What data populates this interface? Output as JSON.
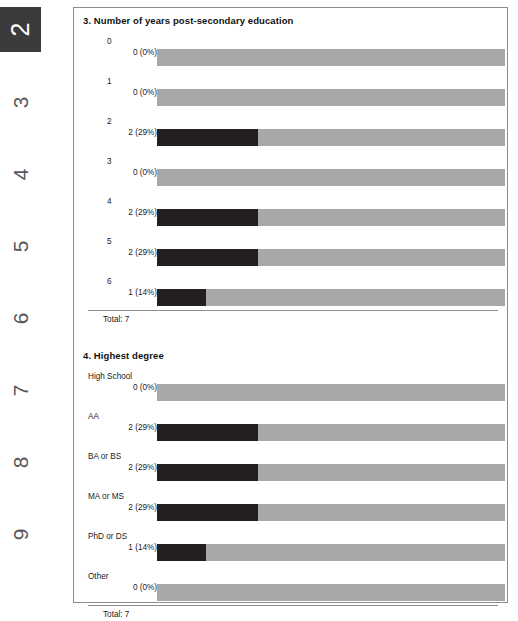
{
  "page_rail": {
    "name": "page-number-rail",
    "active_page": "2",
    "pages": [
      {
        "label": "2",
        "active": true
      },
      {
        "label": "3",
        "active": false
      },
      {
        "label": "4",
        "active": false
      },
      {
        "label": "5",
        "active": false
      },
      {
        "label": "6",
        "active": false
      },
      {
        "label": "7",
        "active": false
      },
      {
        "label": "8",
        "active": false
      },
      {
        "label": "9",
        "active": false
      }
    ]
  },
  "colors": {
    "bar_filled": "#231f20",
    "bar_track": "#a8a8a8",
    "panel_border": "#8d8d8d",
    "active_tab_bg": "#3b3b3b",
    "text": "#1a1a1a"
  },
  "chart_data": [
    {
      "type": "bar",
      "id": "chart1",
      "title": "3. Number of years post-secondary education",
      "orientation": "horizontal",
      "total_label": "Total: 7",
      "total": 7,
      "xlabel": "",
      "ylabel": "",
      "xlim": [
        0,
        100
      ],
      "grid": false,
      "legend": "none",
      "categories": [
        "0",
        "1",
        "2",
        "3",
        "4",
        "5",
        "6"
      ],
      "values": [
        0,
        0,
        2,
        0,
        2,
        2,
        1
      ],
      "percents": [
        0,
        0,
        29,
        0,
        29,
        29,
        14
      ],
      "value_labels": [
        "0 (0%)",
        "0 (0%)",
        "2 (29%)",
        "0 (0%)",
        "2 (29%)",
        "2 (29%)",
        "1 (14%)"
      ],
      "rows": [
        {
          "category": "0",
          "value": 0,
          "percent": 0,
          "value_label": "0 (0%)"
        },
        {
          "category": "1",
          "value": 0,
          "percent": 0,
          "value_label": "0 (0%)"
        },
        {
          "category": "2",
          "value": 2,
          "percent": 29,
          "value_label": "2 (29%)"
        },
        {
          "category": "3",
          "value": 0,
          "percent": 0,
          "value_label": "0 (0%)"
        },
        {
          "category": "4",
          "value": 2,
          "percent": 29,
          "value_label": "2 (29%)"
        },
        {
          "category": "5",
          "value": 2,
          "percent": 29,
          "value_label": "2 (29%)"
        },
        {
          "category": "6",
          "value": 1,
          "percent": 14,
          "value_label": "1 (14%)"
        }
      ]
    },
    {
      "type": "bar",
      "id": "chart2",
      "title": "4. Highest degree",
      "orientation": "horizontal",
      "total_label": "Total: 7",
      "total": 7,
      "xlabel": "",
      "ylabel": "",
      "xlim": [
        0,
        100
      ],
      "grid": false,
      "legend": "none",
      "categories": [
        "High School",
        "AA",
        "BA or BS",
        "MA or MS",
        "PhD or DS",
        "Other"
      ],
      "values": [
        0,
        2,
        2,
        2,
        1,
        0
      ],
      "percents": [
        0,
        29,
        29,
        29,
        14,
        0
      ],
      "value_labels": [
        "0 (0%)",
        "2 (29%)",
        "2 (29%)",
        "2 (29%)",
        "1 (14%)",
        "0 (0%)"
      ],
      "rows": [
        {
          "category": "High School",
          "value": 0,
          "percent": 0,
          "value_label": "0 (0%)"
        },
        {
          "category": "AA",
          "value": 2,
          "percent": 29,
          "value_label": "2 (29%)"
        },
        {
          "category": "BA or BS",
          "value": 2,
          "percent": 29,
          "value_label": "2 (29%)"
        },
        {
          "category": "MA or MS",
          "value": 2,
          "percent": 29,
          "value_label": "2 (29%)"
        },
        {
          "category": "PhD or DS",
          "value": 1,
          "percent": 14,
          "value_label": "1 (14%)"
        },
        {
          "category": "Other",
          "value": 0,
          "percent": 0,
          "value_label": "0 (0%)"
        }
      ]
    }
  ]
}
